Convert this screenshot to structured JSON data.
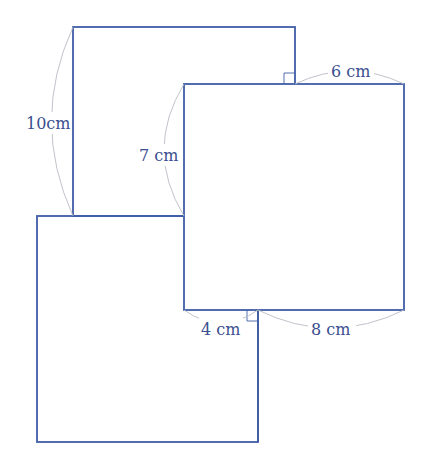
{
  "diagram": {
    "type": "geometry-figure",
    "stroke_color": "#3f5ea8",
    "label_color": "#3a4f8f",
    "labels": {
      "left_height": "10cm",
      "middle_height": "7 cm",
      "top_width": "6 cm",
      "bottom_left_width": "4 cm",
      "bottom_right_width": "8 cm"
    },
    "right_angle_marks": 2
  }
}
